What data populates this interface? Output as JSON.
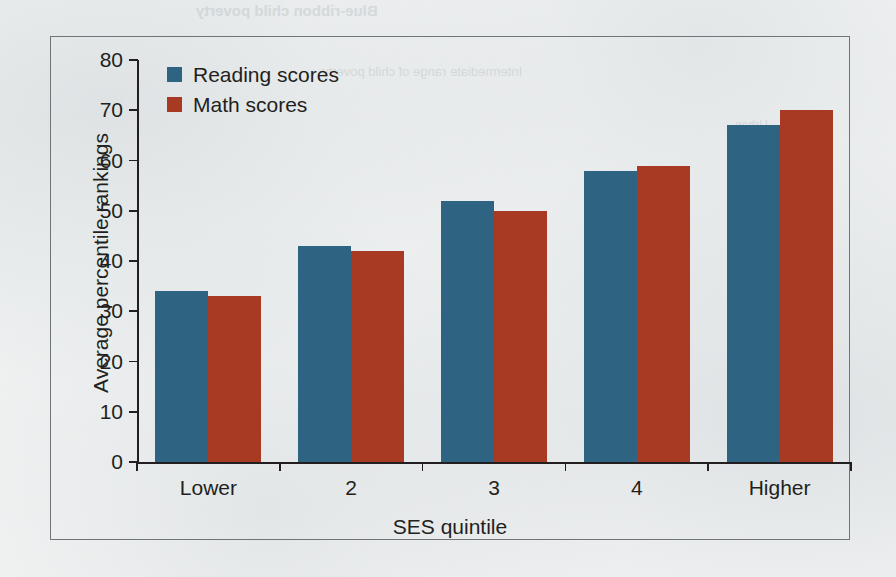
{
  "page": {
    "background_color": "#f2f3f3",
    "bleed_through_text": [
      "Blue-ribbon child poverty",
      "Intermediate range of child poverty",
      "Urban"
    ]
  },
  "chart_data": {
    "type": "bar",
    "title": "",
    "xlabel": "SES quintile",
    "ylabel": "Average percentile rankings",
    "categories": [
      "Lower",
      "2",
      "3",
      "4",
      "Higher"
    ],
    "series": [
      {
        "name": "Reading scores",
        "color": "#2e6382",
        "values": [
          34,
          43,
          52,
          58,
          67
        ]
      },
      {
        "name": "Math scores",
        "color": "#a83a24",
        "values": [
          33,
          42,
          50,
          59,
          70
        ]
      }
    ],
    "ylim": [
      0,
      80
    ],
    "ytick_step": 10,
    "yticks": [
      0,
      10,
      20,
      30,
      40,
      50,
      60,
      70,
      80
    ],
    "grid": false,
    "legend_position": "top-left",
    "axis_color": "#231f20",
    "frame_color": "#6e7478"
  }
}
